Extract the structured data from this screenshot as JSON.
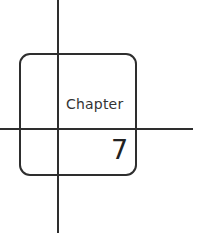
{
  "chapter": {
    "label": "Chapter",
    "number": "7"
  },
  "colors": {
    "line": "#2e2e2e",
    "text": "#333333",
    "background": "#ffffff"
  }
}
